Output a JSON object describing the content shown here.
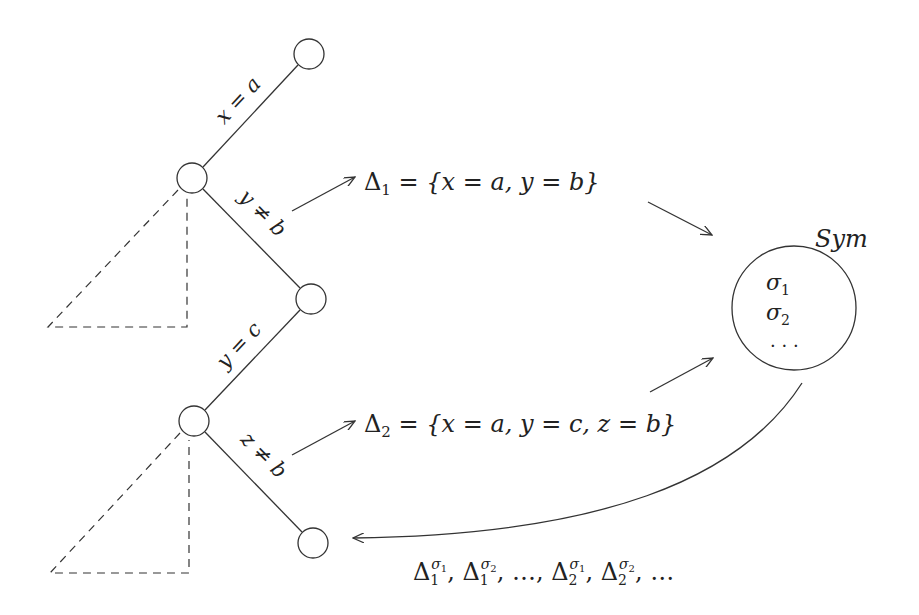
{
  "diagram": {
    "colors": {
      "stroke": "#333333",
      "background": "#ffffff"
    },
    "tree": {
      "nodes": [
        {
          "id": "n1",
          "cx": 309,
          "cy": 54
        },
        {
          "id": "n2",
          "cx": 192,
          "cy": 178
        },
        {
          "id": "n3",
          "cx": 311,
          "cy": 299
        },
        {
          "id": "n4",
          "cx": 194,
          "cy": 421
        },
        {
          "id": "n5",
          "cx": 313,
          "cy": 543
        }
      ],
      "edges": [
        {
          "from": "n2",
          "to": "n1",
          "label": "x = a"
        },
        {
          "from": "n2",
          "to": "n3",
          "label": "y ≠ b"
        },
        {
          "from": "n4",
          "to": "n3",
          "label": "y = c"
        },
        {
          "from": "n4",
          "to": "n5",
          "label": "z ≠ b"
        }
      ],
      "pruned_subtrees": [
        {
          "apex": "n2",
          "label": "⊥"
        },
        {
          "apex": "n4",
          "label": "⊥"
        }
      ]
    },
    "nogoods": [
      {
        "name": "Δ",
        "sub": "1",
        "rest": " = {x = a, y = b}"
      },
      {
        "name": "Δ",
        "sub": "2",
        "rest": " = {x = a, y = c, z = b}"
      }
    ],
    "sym_set": {
      "title": "Sym",
      "items": [
        {
          "name": "σ",
          "sub": "1"
        },
        {
          "name": "σ",
          "sub": "2"
        }
      ],
      "ellipsis": "· · ·"
    },
    "feedback": {
      "terms": [
        {
          "base": "Δ",
          "sub": "1",
          "sup_base": "σ",
          "sup_sub": "1"
        },
        {
          "base": "Δ",
          "sub": "1",
          "sup_base": "σ",
          "sup_sub": "2"
        },
        {
          "text": "…"
        },
        {
          "base": "Δ",
          "sub": "2",
          "sup_base": "σ",
          "sup_sub": "1"
        },
        {
          "base": "Δ",
          "sub": "2",
          "sup_base": "σ",
          "sup_sub": "2"
        },
        {
          "text": "…"
        }
      ],
      "separator": ", "
    }
  }
}
